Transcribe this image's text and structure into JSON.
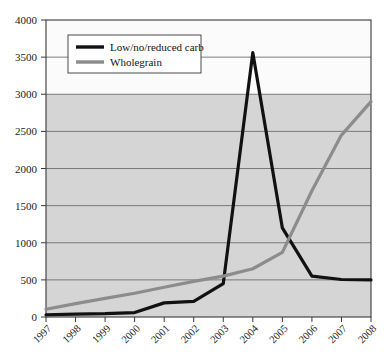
{
  "chart_data": {
    "type": "line",
    "title": "",
    "subtitle": "",
    "xlabel": "",
    "ylabel": "",
    "categories": [
      "1997",
      "1998",
      "1999",
      "2000",
      "2001",
      "2002",
      "2003",
      "2004",
      "2005",
      "2006",
      "2007",
      "2008"
    ],
    "series": [
      {
        "name": "Low/no/reduced carb",
        "color": "#111111",
        "values": [
          30,
          40,
          45,
          60,
          190,
          210,
          450,
          3560,
          1200,
          550,
          505,
          500
        ]
      },
      {
        "name": "Wholegrain",
        "color": "#8c8c8c",
        "values": [
          105,
          180,
          250,
          320,
          400,
          480,
          550,
          650,
          870,
          1700,
          2450,
          2900
        ]
      }
    ],
    "ylim": [
      0,
      4000
    ],
    "yticks": [
      0,
      500,
      1000,
      1500,
      2000,
      2500,
      3000,
      3500,
      4000
    ],
    "ytick_labels": [
      "0",
      "500",
      "1000",
      "1500",
      "2000",
      "2500",
      "3000",
      "3500",
      "4000"
    ],
    "grid": true,
    "legend_position": "top-left",
    "plot_bg_upper": "#fbfbfb",
    "plot_bg_lower": "#d5d5d5",
    "grid_color": "#6e6e6e",
    "axis_color": "#3a3a3a",
    "shade_split_value": 3000
  },
  "legend": {
    "entries": [
      {
        "label": "Low/no/reduced carb"
      },
      {
        "label": "Wholegrain"
      }
    ]
  }
}
